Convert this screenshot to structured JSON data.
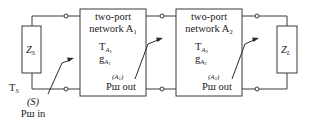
{
  "source": {
    "impedance_label": "Z",
    "impedance_sub": "S",
    "temperature_label": "T",
    "temperature_sub": "S",
    "ref_label": "(S)",
    "power_label": "Pш in"
  },
  "network1": {
    "title_line1": "two-port",
    "title_line2": "network A",
    "title_sub": "1",
    "temp_label": "T",
    "temp_sub": "A",
    "temp_subsub": "1",
    "gain_label": "g",
    "gain_sub": "A",
    "gain_subsub": "1",
    "ref_label": "(A",
    "ref_sub": "1",
    "ref_close": ")",
    "power_label": "Pш out"
  },
  "network2": {
    "title_line1": "two-port",
    "title_line2": "network A",
    "title_sub": "2",
    "temp_label": "T",
    "temp_sub": "A",
    "temp_subsub": "2",
    "gain_label": "g",
    "gain_sub": "A",
    "gain_subsub": "2",
    "ref_label": "(A",
    "ref_sub": "2",
    "ref_close": ")",
    "power_label": "Pш out"
  },
  "load": {
    "impedance_label": "Z",
    "impedance_sub": "L"
  },
  "colors": {
    "line": "#3a3a3a",
    "text": "#222222",
    "background": "#ffffff"
  }
}
